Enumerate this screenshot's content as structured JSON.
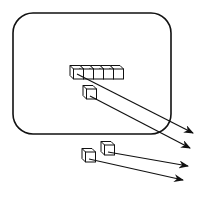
{
  "diagram": {
    "colors": {
      "stroke": "#111111",
      "background": "#ffffff",
      "cube_fill": "#ffffff"
    },
    "container": {
      "shape": "rounded-rectangle",
      "x": 13,
      "y": 13,
      "width": 158,
      "height": 121,
      "radius": 20
    },
    "cube_row": {
      "count": 5,
      "x": 70,
      "y": 69,
      "cube_size": 10
    },
    "cubes": [
      {
        "id": "inside-single",
        "x": 83,
        "y": 89
      },
      {
        "id": "outside-upper",
        "x": 101,
        "y": 145
      },
      {
        "id": "outside-lower",
        "x": 82,
        "y": 152
      }
    ],
    "arrows": [
      {
        "from": [
          77,
          74
        ],
        "to": [
          193,
          133
        ]
      },
      {
        "from": [
          90,
          96
        ],
        "to": [
          190,
          148
        ]
      },
      {
        "from": [
          108,
          152
        ],
        "to": [
          188,
          166
        ]
      },
      {
        "from": [
          89,
          159
        ],
        "to": [
          183,
          180
        ]
      }
    ]
  }
}
